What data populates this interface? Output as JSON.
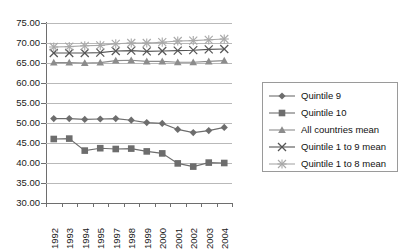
{
  "chart_data": {
    "type": "line",
    "title": "",
    "xlabel": "",
    "ylabel": "",
    "ylim": [
      30.0,
      75.0
    ],
    "ytick_step": 5.0,
    "ytick_labels": [
      "75.00",
      "70.00",
      "65.00",
      "60.00",
      "55.00",
      "50.00",
      "45.00",
      "40.00",
      "35.00",
      "30.00"
    ],
    "ytick_values": [
      75.0,
      70.0,
      65.0,
      60.0,
      55.0,
      50.0,
      45.0,
      40.0,
      35.0,
      30.0
    ],
    "grid": true,
    "grid_axis": "y",
    "legend_position": "right",
    "categories": [
      "1992",
      "1993",
      "1994",
      "1995",
      "1997",
      "1998",
      "1999",
      "2000",
      "2001",
      "2002",
      "2003",
      "2004"
    ],
    "series": [
      {
        "name": "Quintile 9",
        "marker": "diamond",
        "color": "#6d6d6d",
        "values": [
          51.1,
          51.1,
          50.9,
          51.0,
          51.1,
          50.7,
          50.1,
          49.9,
          48.4,
          47.6,
          48.1,
          48.9
        ]
      },
      {
        "name": "Quintile 10",
        "marker": "square",
        "color": "#6d6d6d",
        "values": [
          46.0,
          46.1,
          43.1,
          43.7,
          43.5,
          43.6,
          42.9,
          42.4,
          39.9,
          39.1,
          40.1,
          40.0
        ]
      },
      {
        "name": "All countries mean",
        "marker": "triangle",
        "color": "#8c8c8c",
        "values": [
          65.1,
          65.1,
          65.0,
          65.1,
          65.6,
          65.7,
          65.4,
          65.4,
          65.2,
          65.2,
          65.4,
          65.6
        ]
      },
      {
        "name": "Quintile 1 to 9 mean",
        "marker": "cross",
        "color": "#555555",
        "values": [
          67.5,
          67.5,
          67.5,
          67.6,
          68.0,
          68.1,
          67.9,
          68.0,
          68.1,
          68.2,
          68.4,
          68.5
        ]
      },
      {
        "name": "Quintile 1 to 8 mean",
        "marker": "asterisk",
        "color": "#a8a8a8",
        "values": [
          69.0,
          69.1,
          69.3,
          69.4,
          69.8,
          70.0,
          70.0,
          70.2,
          70.5,
          70.6,
          70.8,
          71.0
        ]
      }
    ]
  },
  "legend": {
    "items": [
      {
        "label": "Quintile 9"
      },
      {
        "label": "Quintile 10"
      },
      {
        "label": "All countries mean"
      },
      {
        "label": "Quintile 1 to 9 mean"
      },
      {
        "label": "Quintile 1 to 8 mean"
      }
    ]
  }
}
